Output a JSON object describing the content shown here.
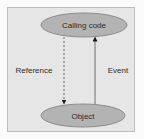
{
  "diagram": {
    "background_color": "#e6e6e6",
    "border_color": "#bdbdbd",
    "node_fill": "#b3b3b3",
    "node_stroke": "#8c8c8c",
    "nodes": [
      {
        "id": "calling-code",
        "label": "Calling code"
      },
      {
        "id": "object",
        "label": "Object"
      }
    ],
    "edges": [
      {
        "from": "calling-code",
        "to": "object",
        "label": "Reference",
        "style": "dashed"
      },
      {
        "from": "object",
        "to": "calling-code",
        "label": "Event",
        "style": "solid"
      }
    ]
  }
}
